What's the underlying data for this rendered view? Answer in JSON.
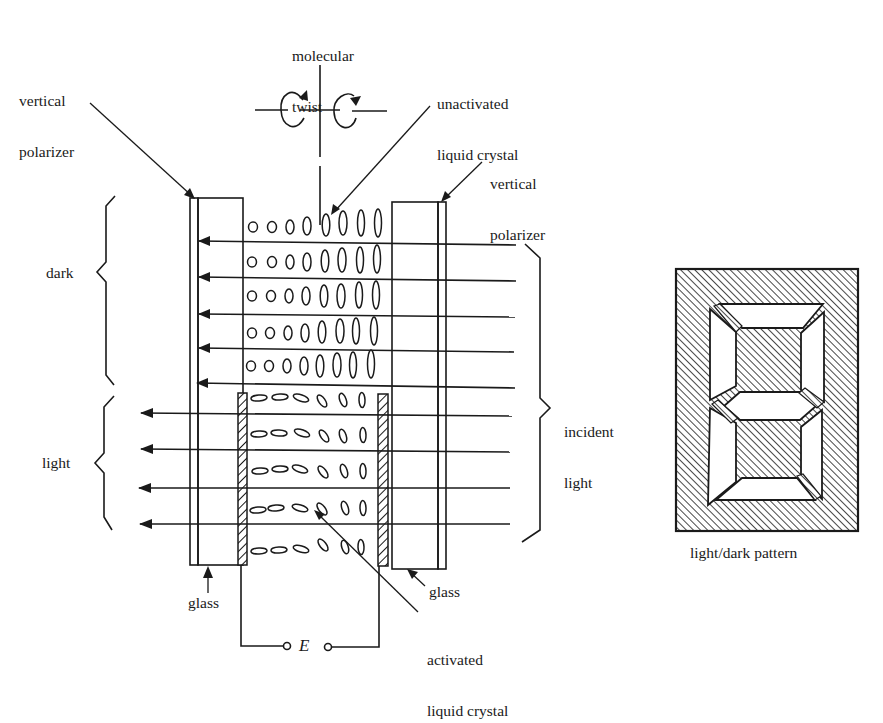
{
  "figure": {
    "labels": {
      "molecular_twist_1": "molecular",
      "molecular_twist_2": "twist",
      "left_polarizer_1": "vertical",
      "left_polarizer_2": "polarizer",
      "right_polarizer_1": "vertical",
      "right_polarizer_2": "polarizer",
      "unactivated_1": "unactivated",
      "unactivated_2": "liquid crystal",
      "dark": "dark",
      "light": "light",
      "incident_1": "incident",
      "incident_2": "light",
      "glass_left": "glass",
      "glass_right": "glass",
      "activated_1": "activated",
      "activated_2": "liquid crystal",
      "voltage": "E",
      "pattern_caption": "light/dark pattern"
    },
    "colors": {
      "ink": "#1a1a1a",
      "paper": "#ffffff"
    },
    "regions": {
      "dark_rows": 5,
      "light_rows": 5,
      "molecules_per_row": 8
    }
  }
}
